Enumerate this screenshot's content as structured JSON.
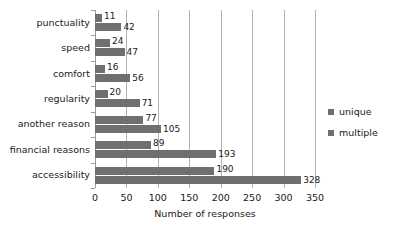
{
  "chart_data": {
    "type": "bar",
    "orientation": "horizontal",
    "title": "",
    "xlabel": "Number of responses",
    "ylabel": "",
    "xlim": [
      0,
      350
    ],
    "xticks": [
      0,
      50,
      100,
      150,
      200,
      250,
      300,
      350
    ],
    "grid": true,
    "legend_position": "right",
    "categories": [
      "punctuality",
      "speed",
      "comfort",
      "regularity",
      "another reason",
      "financial reasons",
      "accessibility"
    ],
    "series": [
      {
        "name": "unique",
        "color": "#6f6f6f",
        "values": [
          11,
          24,
          16,
          20,
          77,
          89,
          190
        ]
      },
      {
        "name": "multiple",
        "color": "#6f6f6f",
        "values": [
          42,
          47,
          56,
          71,
          105,
          193,
          328
        ]
      }
    ]
  },
  "legend": {
    "items": [
      {
        "label": "unique",
        "color": "#6f6f6f"
      },
      {
        "label": "multiple",
        "color": "#6f6f6f"
      }
    ]
  },
  "axis": {
    "x_title": "Number of responses",
    "tick_labels": [
      "0",
      "50",
      "100",
      "150",
      "200",
      "250",
      "300",
      "350"
    ]
  },
  "colors": {
    "bar": "#6f6f6f",
    "gridline": "#b0b0b0",
    "axis": "#9a9a9a",
    "text": "#1a1a1a",
    "background": "#ffffff"
  }
}
